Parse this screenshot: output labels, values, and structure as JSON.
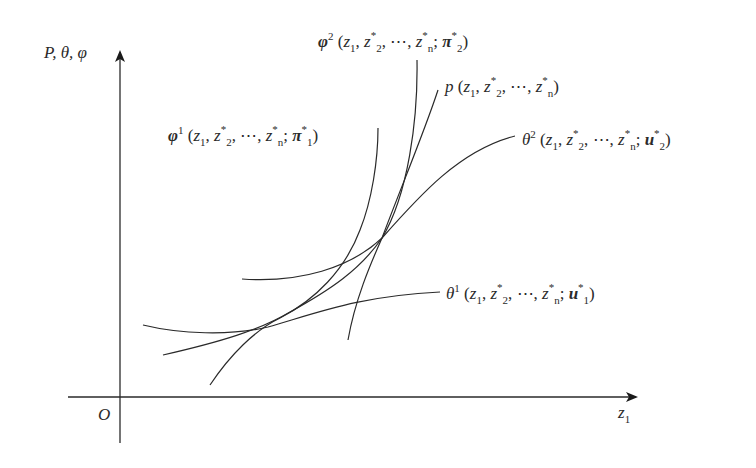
{
  "axes": {
    "y_label": "P, θ, φ",
    "x_label_base": "z",
    "x_label_sub": "1",
    "origin_label": "O"
  },
  "curves": {
    "phi2": {
      "sym": "φ",
      "sup": "2",
      "last": "π",
      "last_sub": "2"
    },
    "phi1": {
      "sym": "φ",
      "sup": "1",
      "last": "π",
      "last_sub": "1"
    },
    "p": {
      "sym": "p"
    },
    "theta2": {
      "sym": "θ",
      "sup": "2",
      "last": "u",
      "last_sub": "2"
    },
    "theta1": {
      "sym": "θ",
      "sup": "1",
      "last": "u",
      "last_sub": "1"
    }
  },
  "args": {
    "open": "(",
    "z": "z",
    "sub1": "1",
    "sub2": "2",
    "subn": "n",
    "star": "*",
    "comma": ", ",
    "dots": "⋯",
    "semicolon": "; ",
    "close": ")"
  },
  "colors": {
    "line": "#2a2a2a",
    "background": "#ffffff"
  }
}
